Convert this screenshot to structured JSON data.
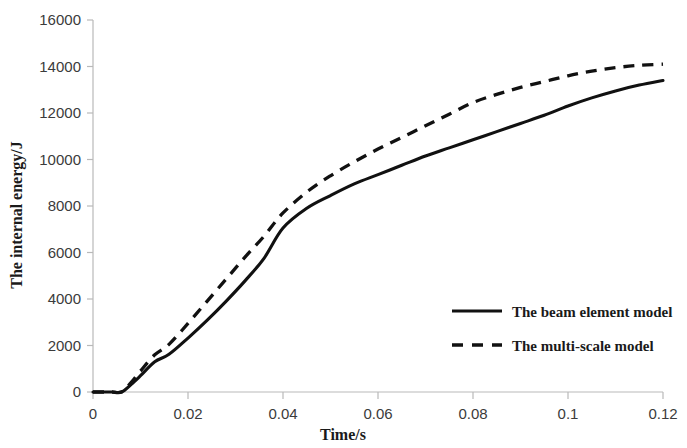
{
  "chart_data": {
    "type": "line",
    "title": "",
    "xlabel": "Time/s",
    "ylabel": "The internal energy/J",
    "xlim": [
      0,
      0.12
    ],
    "ylim": [
      0,
      16000
    ],
    "grid": false,
    "legend_position": "lower-right",
    "xticks": [
      "0",
      "0.02",
      "0.04",
      "0.06",
      "0.08",
      "0.1",
      "0.12"
    ],
    "xtick_values": [
      0,
      0.02,
      0.04,
      0.06,
      0.08,
      0.1,
      0.12
    ],
    "yticks": [
      "0",
      "2000",
      "4000",
      "6000",
      "8000",
      "10000",
      "12000",
      "14000",
      "16000"
    ],
    "ytick_values": [
      0,
      2000,
      4000,
      6000,
      8000,
      10000,
      12000,
      14000,
      16000
    ],
    "series": [
      {
        "name": "The beam element model",
        "style": "solid",
        "color": "#111111",
        "x": [
          0,
          0.002,
          0.004,
          0.006,
          0.008,
          0.01,
          0.013,
          0.016,
          0.02,
          0.024,
          0.028,
          0.032,
          0.036,
          0.04,
          0.045,
          0.05,
          0.055,
          0.06,
          0.065,
          0.07,
          0.075,
          0.08,
          0.085,
          0.09,
          0.095,
          0.1,
          0.105,
          0.11,
          0.115,
          0.12
        ],
        "y": [
          0,
          0,
          0,
          0,
          320,
          700,
          1300,
          1620,
          2320,
          3080,
          3900,
          4780,
          5750,
          7050,
          7900,
          8450,
          8950,
          9350,
          9750,
          10150,
          10500,
          10850,
          11200,
          11550,
          11900,
          12300,
          12650,
          12950,
          13200,
          13400
        ]
      },
      {
        "name": "The multi-scale model",
        "style": "dashed",
        "color": "#111111",
        "x": [
          0,
          0.002,
          0.004,
          0.006,
          0.008,
          0.01,
          0.013,
          0.016,
          0.02,
          0.024,
          0.028,
          0.032,
          0.036,
          0.04,
          0.045,
          0.05,
          0.055,
          0.06,
          0.065,
          0.07,
          0.075,
          0.08,
          0.085,
          0.09,
          0.095,
          0.1,
          0.105,
          0.11,
          0.115,
          0.12
        ],
        "y": [
          0,
          0,
          0,
          0,
          400,
          900,
          1600,
          2050,
          2950,
          3900,
          4850,
          5800,
          6700,
          7700,
          8600,
          9300,
          9900,
          10450,
          10950,
          11450,
          11950,
          12450,
          12800,
          13100,
          13350,
          13600,
          13800,
          13950,
          14050,
          14100
        ]
      }
    ]
  },
  "legend": {
    "items": [
      {
        "label": "The beam element model",
        "style": "solid"
      },
      {
        "label": "The multi-scale model",
        "style": "dashed"
      }
    ]
  }
}
